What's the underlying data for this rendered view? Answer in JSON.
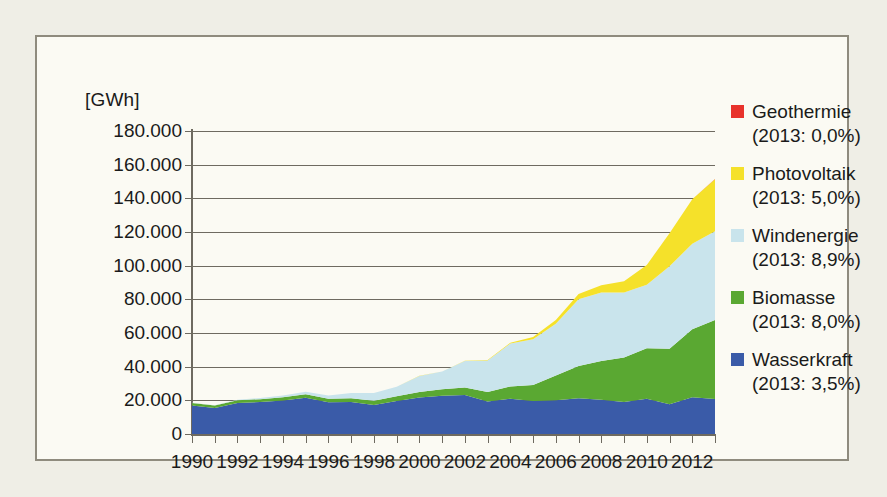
{
  "chart_data": {
    "type": "area",
    "stacked": true,
    "title": "",
    "subtitle": "",
    "xlabel": "",
    "ylabel": "[GWh]",
    "unit": "[GWh]",
    "grid": true,
    "legend_position": "right",
    "ylim": [
      0,
      180000
    ],
    "ytick_step": 20000,
    "ytick_labels": [
      "180.000",
      "160.000",
      "140.000",
      "120.000",
      "100.000",
      "80.000",
      "60.000",
      "40.000",
      "20.000",
      "0"
    ],
    "ytick_values": [
      180000,
      160000,
      140000,
      120000,
      100000,
      80000,
      60000,
      40000,
      20000,
      0
    ],
    "xtick_labels": [
      "1990",
      "1992",
      "1994",
      "1996",
      "1998",
      "2000",
      "2002",
      "2004",
      "2006",
      "2008",
      "2010",
      "2012"
    ],
    "xtick_values": [
      1990,
      1992,
      1994,
      1996,
      1998,
      2000,
      2002,
      2004,
      2006,
      2008,
      2010,
      2012
    ],
    "xlim": [
      1990,
      2013
    ],
    "x": [
      1990,
      1991,
      1992,
      1993,
      1994,
      1995,
      1996,
      1997,
      1998,
      1999,
      2000,
      2001,
      2002,
      2003,
      2004,
      2005,
      2006,
      2007,
      2008,
      2009,
      2010,
      2011,
      2012,
      2013
    ],
    "series": [
      {
        "name": "Wasserkraft",
        "color": "#3a5ba8",
        "legend_note": "(2013: 3,5%)",
        "share_2013_percent": 3.5,
        "values": [
          17000,
          15400,
          18400,
          19000,
          19900,
          21600,
          18800,
          19000,
          17200,
          19600,
          21700,
          22700,
          23100,
          19300,
          20900,
          19600,
          20000,
          21200,
          20400,
          19000,
          21000,
          17700,
          21800,
          20800
        ]
      },
      {
        "name": "Biomasse",
        "color": "#5aa832",
        "legend_note": "(2013: 8,0%)",
        "share_2013_percent": 8.0,
        "values": [
          1400,
          1500,
          1600,
          1700,
          1900,
          2000,
          2100,
          2300,
          2600,
          2900,
          3300,
          3900,
          4500,
          5700,
          7300,
          9500,
          14800,
          19200,
          23000,
          26500,
          29900,
          33000,
          40500,
          46900
        ]
      },
      {
        "name": "Windenergie",
        "color": "#c9e4ec",
        "legend_note": "(2013: 8,9%)",
        "share_2013_percent": 8.9,
        "values": [
          100,
          200,
          300,
          700,
          1000,
          1500,
          2000,
          3000,
          4500,
          5500,
          9500,
          10500,
          15800,
          18700,
          25500,
          27200,
          30700,
          39700,
          40600,
          38600,
          37800,
          48900,
          50700,
          52700
        ]
      },
      {
        "name": "Photovoltaik",
        "color": "#f5e12a",
        "legend_note": "(2013: 5,0%)",
        "share_2013_percent": 5.0,
        "values": [
          1,
          1,
          2,
          3,
          7,
          7,
          20,
          30,
          35,
          30,
          60,
          80,
          160,
          310,
          560,
          1280,
          2220,
          3080,
          4420,
          6580,
          11700,
          19600,
          26400,
          31000
        ]
      },
      {
        "name": "Geothermie",
        "color": "#e8322b",
        "legend_note": "(2013: 0,0%)",
        "share_2013_percent": 0.0,
        "values": [
          0,
          0,
          0,
          0,
          0,
          0,
          0,
          0,
          0,
          0,
          0,
          0,
          0,
          0,
          0,
          0,
          0,
          0,
          0,
          19,
          28,
          19,
          25,
          80
        ]
      }
    ]
  },
  "legend": {
    "entries": [
      {
        "name": "Geothermie",
        "note": "(2013: 0,0%)",
        "color": "#e8322b"
      },
      {
        "name": "Photovoltaik",
        "note": "(2013: 5,0%)",
        "color": "#f5e12a"
      },
      {
        "name": "Windenergie",
        "note": "(2013: 8,9%)",
        "color": "#c9e4ec"
      },
      {
        "name": "Biomasse",
        "note": "(2013: 8,0%)",
        "color": "#5aa832"
      },
      {
        "name": "Wasserkraft",
        "note": "(2013: 3,5%)",
        "color": "#3a5ba8"
      }
    ]
  },
  "colors": {
    "background": "#efeee6",
    "panel": "#fbfaf3",
    "border": "#8f8b7e",
    "axis": "#6e6a60",
    "text": "#1a1a1a"
  }
}
